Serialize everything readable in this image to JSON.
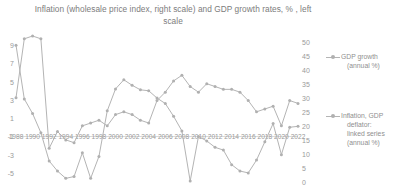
{
  "chart_data": {
    "type": "line",
    "title": "Inflation (wholesale price index, right scale) and GDP growth rates, % , left scale",
    "title_line1": "Inflation (wholesale price index, right scale) and GDP growth rates,",
    "title_line2": "% , left scale",
    "xlabel": "",
    "ylabel": "",
    "grid": false,
    "legend_position": "right",
    "x": [
      1988,
      1989,
      1990,
      1991,
      1992,
      1993,
      1994,
      1995,
      1996,
      1997,
      1998,
      1999,
      2000,
      2001,
      2002,
      2003,
      2004,
      2005,
      2006,
      2007,
      2008,
      2009,
      2010,
      2011,
      2012,
      2013,
      2014,
      2015,
      2016,
      2017,
      2018,
      2019,
      2020,
      2021,
      2022
    ],
    "xticks": [
      "1988",
      "1990",
      "1992",
      "1994",
      "1996",
      "1998",
      "2000",
      "2002",
      "2004",
      "2006",
      "2008",
      "2010",
      "2012",
      "2014",
      "2016",
      "2018",
      "2020",
      "2022"
    ],
    "xtick_values": [
      1988,
      1990,
      1992,
      1994,
      1996,
      1998,
      2000,
      2002,
      2004,
      2006,
      2008,
      2010,
      2012,
      2014,
      2016,
      2018,
      2020,
      2022
    ],
    "xlim": [
      1988,
      2022
    ],
    "left_axis": {
      "name": "GDP growth (annual %)",
      "ticks": [
        "9",
        "7",
        "5",
        "3",
        "1",
        "-1",
        "-3",
        "-5"
      ],
      "tick_values": [
        9,
        7,
        5,
        3,
        1,
        -1,
        -3,
        -5
      ],
      "ylim": [
        -6,
        10
      ]
    },
    "right_axis": {
      "name": "Inflation, GDP deflator: linked series (annual %)",
      "ticks": [
        "50",
        "45",
        "40",
        "35",
        "30",
        "25",
        "20",
        "15",
        "10",
        "5",
        "0"
      ],
      "tick_values": [
        50,
        45,
        40,
        35,
        30,
        25,
        20,
        15,
        10,
        5,
        0
      ],
      "ylim": [
        0,
        52
      ]
    },
    "series": [
      {
        "name": "GDP growth (annual %)",
        "axis": "left",
        "color": "#b4b4b4",
        "values": [
          9.0,
          3.1,
          1.5,
          -0.6,
          -3.7,
          -4.8,
          -5.6,
          -5.4,
          -2.8,
          -5.6,
          -3.2,
          1.8,
          4.2,
          5.2,
          4.6,
          4.1,
          4.0,
          3.2,
          2.6,
          1.2,
          -0.4,
          -5.9,
          -1.0,
          -1.5,
          -2.2,
          -2.5,
          -4.1,
          -4.8,
          -5.0,
          -3.6,
          -1.6,
          0.4,
          -3.0,
          0.0,
          0.1
        ]
      },
      {
        "name": "Inflation, GDP deflator: linked series (annual %)",
        "axis": "right",
        "color": "#b4b4b4",
        "values": [
          30.0,
          51.0,
          52.0,
          51.0,
          12.0,
          18.0,
          15.0,
          14.0,
          20.0,
          21.0,
          22.0,
          20.0,
          24.0,
          25.0,
          24.0,
          22.0,
          21.0,
          29.0,
          32.0,
          36.0,
          38.0,
          34.0,
          32.0,
          35.0,
          34.0,
          33.0,
          33.0,
          32.0,
          29.0,
          25.0,
          26.0,
          27.0,
          20.0,
          29.0,
          28.0
        ]
      }
    ]
  },
  "legend": {
    "entries": [
      {
        "lines": [
          "GDP growth",
          "(annual %)"
        ]
      },
      {
        "lines": [
          "Inflation, GDP",
          "deflator:",
          "linked series",
          "(annual %)"
        ]
      }
    ]
  }
}
